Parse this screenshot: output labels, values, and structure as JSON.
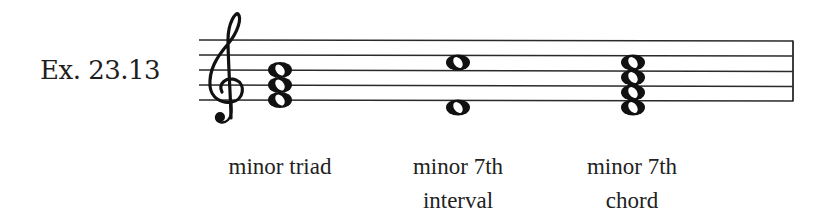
{
  "example": {
    "label": "Ex. 23.13",
    "clef": "treble",
    "colors": {
      "ink": "#1a1a1a",
      "background": "#ffffff"
    }
  },
  "staff": {
    "lines": 5,
    "x_start": 199,
    "x_end": 793,
    "line_y": [
      40,
      55,
      70,
      85,
      100
    ],
    "final_barline": true
  },
  "chords": [
    {
      "name": "minor-triad",
      "caption_line1": "minor triad",
      "caption_line2": "",
      "notes": [
        "E4",
        "G4",
        "B4"
      ],
      "x": 280
    },
    {
      "name": "minor-7th-interval",
      "caption_line1": "minor 7th",
      "caption_line2": "interval",
      "notes": [
        "D4",
        "C5"
      ],
      "x": 458
    },
    {
      "name": "minor-7th-chord",
      "caption_line1": "minor 7th",
      "caption_line2": "chord",
      "notes": [
        "D4",
        "F4",
        "A4",
        "C5"
      ],
      "x": 633
    }
  ]
}
